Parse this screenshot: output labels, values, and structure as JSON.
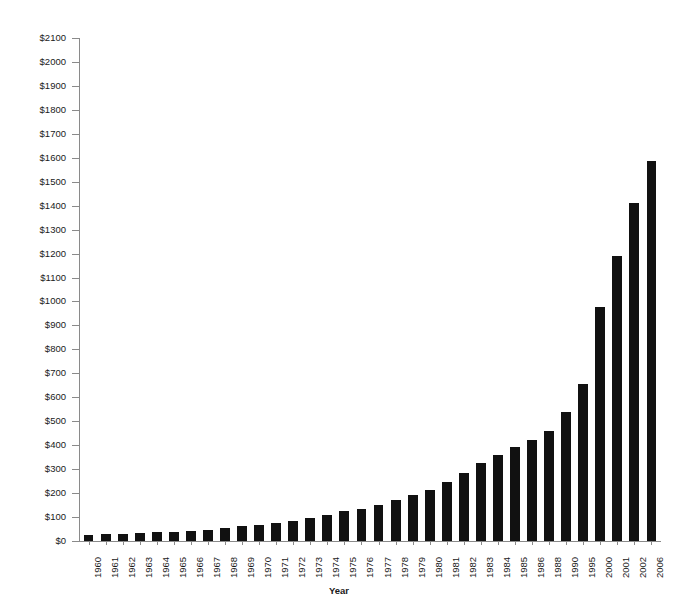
{
  "chart_data": {
    "type": "bar",
    "title": "",
    "xlabel": "Year",
    "ylabel": "",
    "ylim": [
      0,
      2100
    ],
    "ytick_step": 100,
    "grid": false,
    "legend": null,
    "bar_color": "#111111",
    "axis_color": "#8a8a8a",
    "categories": [
      "1960",
      "1961",
      "1962",
      "1963",
      "1964",
      "1965",
      "1966",
      "1967",
      "1968",
      "1969",
      "1970",
      "1971",
      "1972",
      "1973",
      "1974",
      "1975",
      "1976",
      "1977",
      "1978",
      "1979",
      "1980",
      "1981",
      "1982",
      "1983",
      "1984",
      "1985",
      "1986",
      "1988",
      "1990",
      "1995",
      "2000",
      "2001",
      "2002",
      "2006"
    ],
    "values": [
      25,
      28,
      30,
      32,
      36,
      38,
      42,
      48,
      55,
      62,
      68,
      75,
      82,
      95,
      110,
      125,
      135,
      152,
      170,
      192,
      212,
      245,
      285,
      325,
      360,
      392,
      420,
      458,
      538,
      655,
      975,
      1192,
      1412,
      1588
    ],
    "ytick_labels": [
      "$0",
      "$100",
      "$200",
      "$300",
      "$400",
      "$500",
      "$600",
      "$700",
      "$800",
      "$900",
      "$1000",
      "$1100",
      "$1200",
      "$1300",
      "$1400",
      "$1500",
      "$1600",
      "$1700",
      "$1800",
      "$1900",
      "$2000",
      "$2100"
    ],
    "ytick_values": [
      0,
      100,
      200,
      300,
      400,
      500,
      600,
      700,
      800,
      900,
      1000,
      1100,
      1200,
      1300,
      1400,
      1500,
      1600,
      1700,
      1800,
      1900,
      2000,
      2100
    ]
  },
  "axis": {
    "x_title": "Year"
  }
}
